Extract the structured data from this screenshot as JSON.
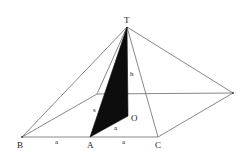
{
  "figure": {
    "type": "square pyramid with cross-section",
    "colors": {
      "edges": "#6a6a6a",
      "shaded_triangle": "#0d0d0d",
      "labels": "#1a1a1a",
      "background": "#ffffff"
    },
    "vertices": {
      "apex": {
        "label": "T",
        "x": 127,
        "y": 27
      },
      "base_front_left": {
        "label": "B",
        "x": 22,
        "y": 137
      },
      "base_front_mid": {
        "label": "A",
        "x": 90,
        "y": 137
      },
      "base_front_right": {
        "label": "C",
        "x": 158,
        "y": 137
      },
      "base_back_right": {
        "label": "",
        "x": 233,
        "y": 93
      },
      "base_back_left": {
        "label": "",
        "x": 97,
        "y": 94
      },
      "center": {
        "label": "O",
        "x": 128,
        "y": 116
      }
    },
    "labels": {
      "T": "T",
      "B": "B",
      "A": "A",
      "C": "C",
      "O": "O",
      "h": "h",
      "s": "s",
      "a_BA": "a",
      "a_AC": "a",
      "a_AO": "a"
    }
  }
}
